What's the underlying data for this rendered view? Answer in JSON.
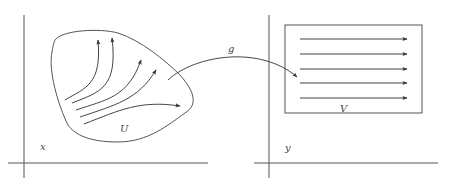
{
  "figure": {
    "type": "diagram",
    "left_space": {
      "axis_label": "x",
      "region_label": "U",
      "flow_line_count": 5
    },
    "map": {
      "label": "g"
    },
    "right_space": {
      "axis_label": "y",
      "region_label": "V",
      "flow_line_count": 5
    },
    "colors": {
      "line": "#555555",
      "text": "#444444",
      "background": "#ffffff"
    }
  }
}
